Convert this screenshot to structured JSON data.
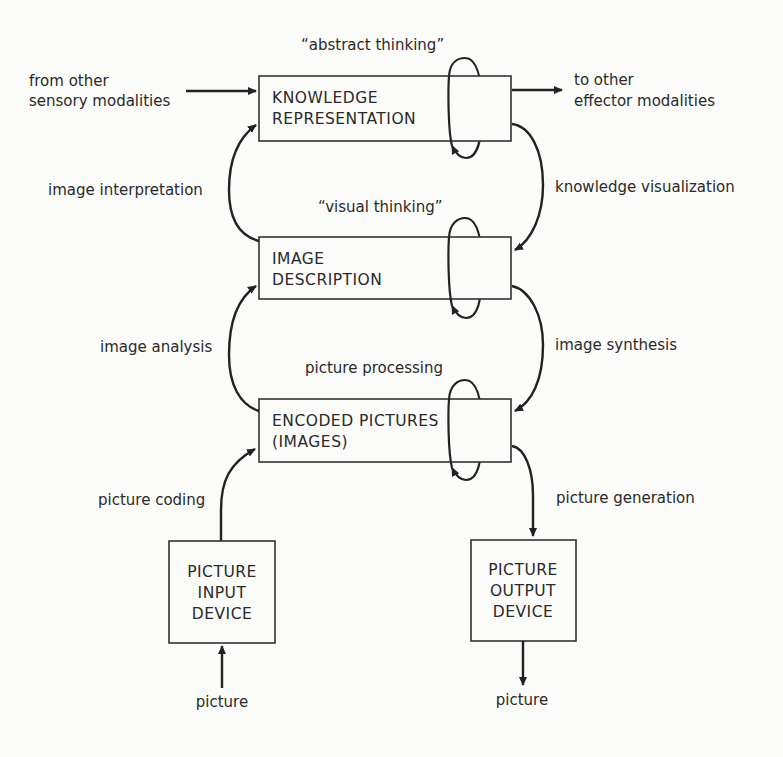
{
  "diagram": {
    "boxes": {
      "knowledge": {
        "line1": "KNOWLEDGE",
        "line2": "REPRESENTATION"
      },
      "description": {
        "line1": "IMAGE",
        "line2": "DESCRIPTION"
      },
      "encoded": {
        "line1": "ENCODED PICTURES",
        "line2": "(IMAGES)"
      },
      "input_device": {
        "line1": "PICTURE",
        "line2": "INPUT",
        "line3": "DEVICE"
      },
      "output_device": {
        "line1": "PICTURE",
        "line2": "OUTPUT",
        "line3": "DEVICE"
      }
    },
    "labels": {
      "from_other_1": "from other",
      "from_other_2": "sensory modalities",
      "to_other_1": "to other",
      "to_other_2": "effector modalities",
      "abstract_thinking": "“abstract thinking”",
      "visual_thinking": "“visual thinking”",
      "picture_processing": "picture processing",
      "image_interpretation": "image interpretation",
      "knowledge_visualization": "knowledge visualization",
      "image_analysis": "image analysis",
      "image_synthesis": "image synthesis",
      "picture_coding": "picture coding",
      "picture_generation": "picture generation",
      "picture_in": "picture",
      "picture_out": "picture"
    }
  }
}
